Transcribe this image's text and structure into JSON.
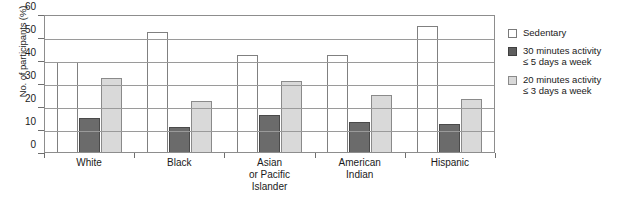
{
  "chart_data": {
    "type": "bar",
    "title": "",
    "xlabel": "",
    "ylabel": "No. of participants (%)",
    "ylim": [
      0,
      60
    ],
    "ytick_step": 10,
    "yticks": [
      60,
      50,
      40,
      30,
      20,
      10,
      0
    ],
    "grid": true,
    "legend_position": "right",
    "categories": [
      "White",
      "Asian or Pacific Islander",
      "Black",
      "American Indian",
      "Hispanic"
    ],
    "category_lines": [
      [
        "White"
      ],
      [
        "Black"
      ],
      [
        "Asian",
        "or Pacific",
        "Islander"
      ],
      [
        "American",
        "Indian"
      ],
      [
        "Hispanic"
      ]
    ],
    "series": [
      {
        "name": "Sedentary",
        "legend_lines": [
          "Sedentary"
        ],
        "color": "#ffffff",
        "values": [
          39,
          52,
          42,
          42,
          55
        ]
      },
      {
        "name": "30 minutes activity ≤ 5 days a week",
        "legend_lines": [
          "30 minutes activity",
          "≤ 5 days a week"
        ],
        "color": "#6b6b6b",
        "values": [
          15,
          11,
          16,
          13,
          12
        ]
      },
      {
        "name": "20 minutes activity ≤ 3 days a week",
        "legend_lines": [
          "20 minutes activity",
          "≤ 3 days a week"
        ],
        "color": "#d9d9d9",
        "values": [
          32,
          22,
          31,
          25,
          23
        ]
      }
    ]
  }
}
